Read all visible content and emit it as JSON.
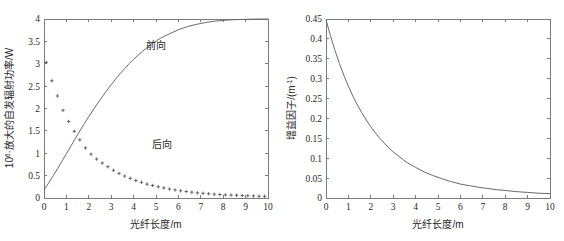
{
  "figure": {
    "background": "#ffffff",
    "curve_color": "#6a6a6a",
    "axis_color": "#7a7a7a",
    "marker_color": "#5a5a5a",
    "text_color": "#1f1f1f"
  },
  "chart_data": [
    {
      "id": "left",
      "type": "line",
      "title": "",
      "subtitle": "",
      "xlabel": "光纤长度/m",
      "ylabel_parts": {
        "base": "10",
        "exponent": "6",
        "rest": "·放大的自发辐射功率/W"
      },
      "ylabel": "10⁶·放大的自发辐射功率/W",
      "xlim": [
        0,
        10
      ],
      "ylim": [
        0,
        4
      ],
      "grid": false,
      "legend_position": "inline-annotation",
      "xticks": [
        0,
        1,
        2,
        3,
        4,
        5,
        6,
        7,
        8,
        9,
        10
      ],
      "xticklabels": [
        "0",
        "1",
        "2",
        "3",
        "4",
        "5",
        "6",
        "7",
        "8",
        "9",
        "10"
      ],
      "yticks": [
        0,
        0.5,
        1,
        1.5,
        2,
        2.5,
        3,
        3.5,
        4
      ],
      "yticklabels": [
        "0",
        "0.5",
        "1",
        "1.5",
        "2",
        "2.5",
        "3",
        "3.5",
        "4"
      ],
      "annotations": [
        {
          "text": "前向",
          "x": 4.55,
          "y": 3.32
        },
        {
          "text": "后向",
          "x": 4.8,
          "y": 1.12
        }
      ],
      "series": [
        {
          "name": "前向",
          "style": "line",
          "x": [
            0,
            0.2,
            0.4,
            0.6,
            0.8,
            1.0,
            1.2,
            1.4,
            1.6,
            1.8,
            2.0,
            2.2,
            2.4,
            2.6,
            2.8,
            3.0,
            3.2,
            3.4,
            3.6,
            3.8,
            4.0,
            4.4,
            4.8,
            5.2,
            5.6,
            6.0,
            6.4,
            6.8,
            7.2,
            7.6,
            8.0,
            8.5,
            9.0,
            9.5,
            10.0
          ],
          "values": [
            0.18,
            0.33,
            0.49,
            0.65,
            0.82,
            0.99,
            1.16,
            1.33,
            1.5,
            1.66,
            1.82,
            1.97,
            2.12,
            2.26,
            2.4,
            2.53,
            2.66,
            2.78,
            2.89,
            3.0,
            3.1,
            3.28,
            3.44,
            3.57,
            3.67,
            3.76,
            3.83,
            3.88,
            3.92,
            3.95,
            3.97,
            3.985,
            3.993,
            3.998,
            4.0
          ]
        },
        {
          "name": "后向",
          "style": "markers",
          "marker": "plus",
          "x": [
            0.1,
            0.35,
            0.6,
            0.85,
            1.1,
            1.35,
            1.6,
            1.85,
            2.1,
            2.35,
            2.6,
            2.85,
            3.1,
            3.35,
            3.6,
            3.85,
            4.1,
            4.35,
            4.6,
            4.85,
            5.1,
            5.35,
            5.6,
            5.85,
            6.1,
            6.35,
            6.6,
            6.85,
            7.1,
            7.35,
            7.6,
            7.85,
            8.1,
            8.35,
            8.6,
            8.85,
            9.1,
            9.35,
            9.6,
            9.85
          ],
          "values": [
            3.03,
            2.62,
            2.28,
            1.96,
            1.71,
            1.49,
            1.3,
            1.12,
            0.98,
            0.87,
            0.78,
            0.7,
            0.62,
            0.55,
            0.49,
            0.44,
            0.39,
            0.35,
            0.31,
            0.28,
            0.25,
            0.225,
            0.2,
            0.18,
            0.16,
            0.145,
            0.13,
            0.115,
            0.105,
            0.095,
            0.085,
            0.078,
            0.07,
            0.065,
            0.06,
            0.055,
            0.05,
            0.045,
            0.04,
            0.038
          ]
        }
      ]
    },
    {
      "id": "right",
      "type": "line",
      "title": "",
      "subtitle": "",
      "xlabel": "光纤长度/m",
      "ylabel_parts": {
        "base": "增益因子/(m",
        "exponent": "-1",
        "rest": ")"
      },
      "ylabel": "增益因子/(m⁻¹)",
      "xlim": [
        0,
        10
      ],
      "ylim": [
        0,
        0.45
      ],
      "grid": false,
      "legend_position": "none",
      "xticks": [
        0,
        1,
        2,
        3,
        4,
        5,
        6,
        7,
        8,
        9,
        10
      ],
      "xticklabels": [
        "0",
        "1",
        "2",
        "3",
        "4",
        "5",
        "6",
        "7",
        "8",
        "9",
        "10"
      ],
      "yticks": [
        0,
        0.05,
        0.1,
        0.15,
        0.2,
        0.25,
        0.3,
        0.35,
        0.4,
        0.45
      ],
      "yticklabels": [
        "0",
        "0.05",
        "0.1",
        "0.15",
        "0.2",
        "0.25",
        "0.3",
        "0.35",
        "0.4",
        "0.45"
      ],
      "annotations": [],
      "series": [
        {
          "name": "增益因子",
          "style": "line",
          "x": [
            0,
            0.2,
            0.4,
            0.6,
            0.8,
            1.0,
            1.2,
            1.4,
            1.6,
            1.8,
            2.0,
            2.2,
            2.4,
            2.6,
            2.8,
            3.0,
            3.2,
            3.4,
            3.6,
            3.8,
            4.0,
            4.4,
            4.8,
            5.2,
            5.6,
            6.0,
            6.4,
            6.8,
            7.2,
            7.6,
            8.0,
            8.5,
            9.0,
            9.5,
            10.0
          ],
          "values": [
            0.448,
            0.408,
            0.371,
            0.338,
            0.308,
            0.281,
            0.256,
            0.234,
            0.214,
            0.196,
            0.179,
            0.164,
            0.15,
            0.138,
            0.126,
            0.116,
            0.107,
            0.098,
            0.09,
            0.083,
            0.077,
            0.065,
            0.056,
            0.048,
            0.041,
            0.035,
            0.031,
            0.027,
            0.024,
            0.021,
            0.019,
            0.016,
            0.014,
            0.012,
            0.011
          ]
        }
      ]
    }
  ]
}
